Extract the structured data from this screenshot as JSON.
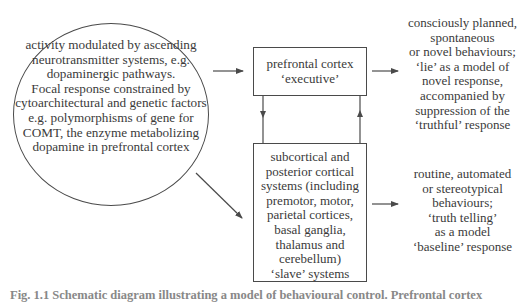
{
  "diagram": {
    "influences_circle": {
      "lines": [
        "activity modulated by ascending",
        "neurotransmitter systems, e.g.",
        "dopaminergic pathways.",
        "Focal response constrained by",
        "cytoarchitectural and genetic factors",
        "e.g. polymorphisms of gene for",
        "COMT, the enzyme metabolizing",
        "dopamine in prefrontal cortex"
      ]
    },
    "executive_box": {
      "lines": [
        "prefrontal cortex",
        "‘executive’"
      ]
    },
    "slave_box": {
      "lines": [
        "subcortical and",
        "posterior cortical",
        "systems (including",
        "premotor, motor,",
        "parietal cortices,",
        "basal ganglia,",
        "thalamus and",
        "cerebellum)",
        "‘slave’ systems"
      ]
    },
    "executive_output": {
      "lines": [
        "consciously planned,",
        "spontaneous",
        "or novel behaviours;",
        "‘lie’ as a model of",
        "novel response,",
        "accompanied by",
        "suppression of the",
        "‘truthful’ response"
      ]
    },
    "slave_output": {
      "lines": [
        "routine, automated",
        "or stereotypical",
        "behaviours;",
        "‘truth telling’",
        "as a model",
        "‘baseline’ response"
      ]
    },
    "arrows": [
      {
        "from": "influences_circle",
        "to": "executive_box"
      },
      {
        "from": "influences_circle",
        "to": "slave_box"
      },
      {
        "from": "executive_box",
        "to": "slave_box"
      },
      {
        "from": "slave_box",
        "to": "executive_box"
      },
      {
        "from": "executive_box",
        "to": "executive_output"
      },
      {
        "from": "slave_box",
        "to": "slave_output"
      }
    ],
    "line_color": "#4a4a4a"
  },
  "caption": {
    "text": "Fig. 1.1 Schematic diagram illustrating a model of behavioural control. Prefrontal cortex"
  }
}
